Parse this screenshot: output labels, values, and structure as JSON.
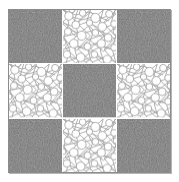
{
  "image": {
    "title": "Checkerboard texture pattern",
    "width": 179,
    "height": 182,
    "background_color": "#ffffff",
    "frame": {
      "border_color": "#8c8c8c",
      "shadow_color": "#787878",
      "gap_color": "#ffffff",
      "gap_width_px": 1,
      "left_px": 8,
      "top_px": 9,
      "width_px": 163,
      "height_px": 164
    }
  },
  "pattern": {
    "type": "checkerboard",
    "rows": 3,
    "columns": 3,
    "texture_names": [
      "dark-speckle-texture",
      "light-pebble-texture"
    ],
    "layout": [
      [
        "dark",
        "light",
        "dark"
      ],
      [
        "light",
        "dark",
        "light"
      ],
      [
        "dark",
        "light",
        "dark"
      ]
    ],
    "cells": [
      {
        "row": 1,
        "col": 1,
        "texture": "dark",
        "label": "cell-r1c1-dark-speckle"
      },
      {
        "row": 1,
        "col": 2,
        "texture": "light",
        "label": "cell-r1c2-light-pebble"
      },
      {
        "row": 1,
        "col": 3,
        "texture": "dark",
        "label": "cell-r1c3-dark-speckle"
      },
      {
        "row": 2,
        "col": 1,
        "texture": "light",
        "label": "cell-r2c1-light-pebble"
      },
      {
        "row": 2,
        "col": 2,
        "texture": "dark",
        "label": "cell-r2c2-dark-speckle"
      },
      {
        "row": 2,
        "col": 3,
        "texture": "light",
        "label": "cell-r2c3-light-pebble"
      },
      {
        "row": 3,
        "col": 1,
        "texture": "dark",
        "label": "cell-r3c1-dark-speckle"
      },
      {
        "row": 3,
        "col": 2,
        "texture": "light",
        "label": "cell-r3c2-light-pebble"
      },
      {
        "row": 3,
        "col": 3,
        "texture": "dark",
        "label": "cell-r3c3-dark-speckle"
      }
    ]
  },
  "textures": {
    "dark": {
      "name": "dark-speckle-texture",
      "description": "fine-grained random noise speckle",
      "base_color": "#6e6e6e",
      "speck_light": "#9a9a9a",
      "speck_dark": "#4a4a4a",
      "grain_size_px": 1
    },
    "light": {
      "name": "light-pebble-texture",
      "description": "dense network of overlapping circles joined by straight lines",
      "base_color": "#ffffff",
      "line_color": "#9b9b9b",
      "circle_fill": "#fdfdfd",
      "line_width_px": 0.8,
      "circle_radius_px": 4
    }
  }
}
